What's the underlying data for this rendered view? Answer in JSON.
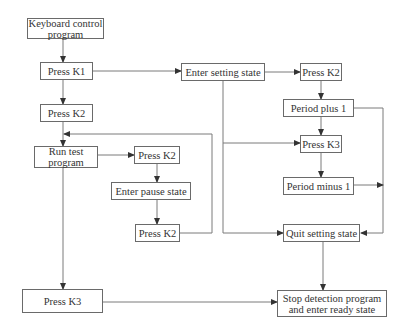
{
  "diagram": {
    "type": "flowchart",
    "nodes": {
      "keyboard_control": {
        "line1": "Keyboard control",
        "line2": "program"
      },
      "press_k1": {
        "label": "Press K1"
      },
      "press_k2_left": {
        "label": "Press K2"
      },
      "run_test": {
        "line1": "Run test",
        "line2": "program"
      },
      "press_k2_mid": {
        "label": "Press K2"
      },
      "enter_pause": {
        "label": "Enter pause state"
      },
      "press_k2_pause": {
        "label": "Press K2"
      },
      "press_k3_left": {
        "label": "Press K3"
      },
      "enter_setting": {
        "label": "Enter setting state"
      },
      "press_k2_right": {
        "label": "Press K2"
      },
      "period_plus": {
        "label": "Period plus 1"
      },
      "press_k3_right": {
        "label": "Press K3"
      },
      "period_minus": {
        "label": "Period minus 1"
      },
      "quit_setting": {
        "label": "Quit setting state"
      },
      "stop_detection": {
        "line1": "Stop detection program",
        "line2": "and enter ready state"
      }
    },
    "edges": [
      [
        "keyboard_control",
        "press_k1"
      ],
      [
        "press_k1",
        "press_k2_left"
      ],
      [
        "press_k1",
        "enter_setting"
      ],
      [
        "press_k2_left",
        "run_test"
      ],
      [
        "run_test",
        "press_k2_mid"
      ],
      [
        "run_test",
        "press_k3_left"
      ],
      [
        "press_k2_mid",
        "enter_pause"
      ],
      [
        "enter_pause",
        "press_k2_pause"
      ],
      [
        "press_k2_pause",
        "run_test"
      ],
      [
        "enter_setting",
        "press_k2_right"
      ],
      [
        "enter_setting",
        "press_k3_right"
      ],
      [
        "enter_setting",
        "quit_setting"
      ],
      [
        "press_k2_right",
        "period_plus"
      ],
      [
        "period_plus",
        "press_k3_right"
      ],
      [
        "period_plus",
        "quit_setting"
      ],
      [
        "press_k3_right",
        "period_minus"
      ],
      [
        "period_minus",
        "quit_setting"
      ],
      [
        "quit_setting",
        "stop_detection"
      ],
      [
        "press_k3_left",
        "stop_detection"
      ]
    ],
    "colors": {
      "line": "#6a6a6a",
      "text": "#333333",
      "background": "#ffffff"
    }
  }
}
